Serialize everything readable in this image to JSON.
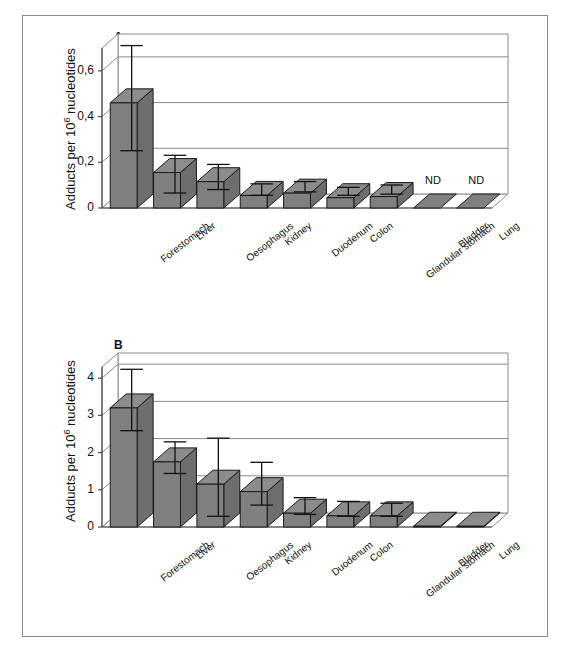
{
  "figure": {
    "axis_label": "Adducts per 10",
    "axis_label_sup": "6",
    "axis_label_tail": " nucleotides",
    "nd_label": "ND",
    "bar_fill": "#808080",
    "bar_top_fill": "#8c8c8c",
    "bar_side_fill": "#6e6e6e",
    "bar_stroke": "#1a1a1a",
    "wall_stroke": "#8a8a8a",
    "axis_stroke": "#4a4a4a",
    "error_stroke": "#111111"
  },
  "panels": [
    {
      "letter": "A",
      "yticks": [
        "0",
        "0,2",
        "0,4",
        "0,6"
      ],
      "ytick_values": [
        0,
        0.2,
        0.4,
        0.6
      ]
    },
    {
      "letter": "B",
      "yticks": [
        "0",
        "1",
        "2",
        "3",
        "4"
      ],
      "ytick_values": [
        0,
        1,
        2,
        3,
        4
      ]
    }
  ],
  "chart_data": [
    {
      "type": "bar",
      "title": "A",
      "xlabel": "",
      "ylabel": "Adducts per 10^6 nucleotides",
      "ylim": [
        0,
        0.7
      ],
      "yticks": [
        0,
        0.2,
        0.4,
        0.6
      ],
      "ytick_labels": [
        "0",
        "0,2",
        "0,4",
        "0,6"
      ],
      "grid": true,
      "legend": "none",
      "categories": [
        "Forestomach",
        "Liver",
        "Oesophagus",
        "Kidney",
        "Duodenum",
        "Colon",
        "Glandular stomach",
        "Bladder",
        "Lung"
      ],
      "values": [
        0.46,
        0.155,
        0.115,
        0.055,
        0.065,
        0.045,
        0.05,
        0,
        0
      ],
      "error_high": [
        0.68,
        0.2,
        0.16,
        0.075,
        0.085,
        0.06,
        0.07,
        null,
        null
      ],
      "error_low": [
        0.22,
        0.035,
        0.05,
        0.025,
        0.04,
        0.025,
        0.03,
        null,
        null
      ],
      "annotations": [
        {
          "category": "Bladder",
          "text": "ND"
        },
        {
          "category": "Lung",
          "text": "ND"
        }
      ]
    },
    {
      "type": "bar",
      "title": "B",
      "xlabel": "",
      "ylabel": "Adducts per 10^6 nucleotides",
      "ylim": [
        0,
        4.3
      ],
      "yticks": [
        0,
        1,
        2,
        3,
        4
      ],
      "ytick_labels": [
        "0",
        "1",
        "2",
        "3",
        "4"
      ],
      "grid": true,
      "legend": "none",
      "categories": [
        "Forestomach",
        "Liver",
        "Oesophagus",
        "Kidney",
        "Duodenum",
        "Colon",
        "Glandular stomach",
        "Bladder",
        "Lung"
      ],
      "values": [
        3.2,
        1.75,
        1.15,
        0.95,
        0.37,
        0.3,
        0.3,
        0.02,
        0.02
      ],
      "error_high": [
        4.05,
        2.1,
        2.2,
        1.55,
        0.6,
        0.5,
        0.45,
        null,
        null
      ],
      "error_low": [
        2.4,
        1.25,
        0.1,
        0.4,
        0.15,
        0.1,
        0.1,
        null,
        null
      ],
      "annotations": []
    }
  ]
}
